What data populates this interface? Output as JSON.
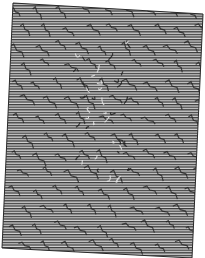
{
  "artwork": {
    "description": "Rotated line-hatched panel with squiggle pattern",
    "canvas": {
      "width": 205,
      "height": 258
    },
    "panel_corners": [
      [
        13,
        3
      ],
      [
        203,
        14
      ],
      [
        192,
        258
      ],
      [
        2,
        248
      ]
    ],
    "line_period": 2.6,
    "colors": {
      "background": "#ffffff",
      "panel_fill": "#b8b8b8",
      "line_dark": "#3a3a3a",
      "line_light": "#d4d4d4",
      "squiggle": "#1e1e1e",
      "border": "#2a2a2a"
    },
    "squiggle_rows": 14,
    "squiggle_cols": 9
  }
}
